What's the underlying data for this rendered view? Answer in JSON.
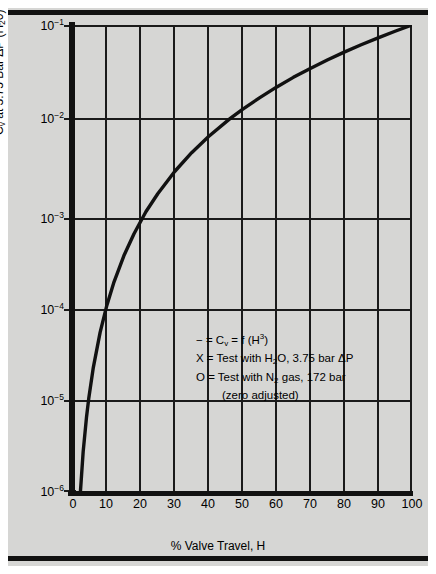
{
  "figure": {
    "background_color": "#d6d6d4",
    "line_color": "#111111"
  },
  "axes": {
    "x": {
      "title": "% Valve Travel, H",
      "ticks": [
        "0",
        "10",
        "20",
        "30",
        "40",
        "50",
        "60",
        "70",
        "80",
        "90",
        "100"
      ],
      "min": 0,
      "max": 100
    },
    "y": {
      "title_parts": {
        "pre": "C",
        "sub": "v",
        "post": " at 3.75 Bar ΔP (H",
        "sub2": "2",
        "post2": "0)"
      },
      "title": "Cv at 3.75 Bar ΔP (H20)",
      "ticks": [
        {
          "mantissa": "10",
          "exp": "−1"
        },
        {
          "mantissa": "10",
          "exp": "−2"
        },
        {
          "mantissa": "10",
          "exp": "−3"
        },
        {
          "mantissa": "10",
          "exp": "−4"
        },
        {
          "mantissa": "10",
          "exp": "−5"
        },
        {
          "mantissa": "10",
          "exp": "−6"
        }
      ],
      "scale": "log",
      "min": 1e-06,
      "max": 0.1
    }
  },
  "legend": {
    "line1_dash": "−",
    "line1_eq": " = C",
    "line1_sub": "v",
    "line1_mid": " = f (H",
    "line1_sup": "3",
    "line1_end": ")",
    "line2_sym": "X",
    "line2_a": " = Test with H",
    "line2_sub": "2",
    "line2_b": "O, 3.75 bar ΔP",
    "line3_sym": "O",
    "line3_a": " = Test with N",
    "line3_sub": "2",
    "line3_b": " gas, 172 bar",
    "line4": "(zero adjusted)"
  },
  "chart_data": {
    "type": "line",
    "title": "",
    "xlabel": "% Valve Travel, H",
    "ylabel": "Cv at 3.75 Bar ΔP (H20)",
    "xlim": [
      0,
      100
    ],
    "ylim": [
      1e-06,
      0.1
    ],
    "yscale": "log",
    "xscale": "linear",
    "grid": true,
    "legend_position": "center",
    "xticks": [
      0,
      10,
      20,
      30,
      40,
      50,
      60,
      70,
      80,
      90,
      100
    ],
    "yticks": [
      1e-06,
      1e-05,
      0.0001,
      0.001,
      0.01,
      0.1
    ],
    "series": [
      {
        "name": "Cv = f (H^3)",
        "relation": "Cv = 1e-7 * H^3",
        "x": [
          1,
          2,
          3,
          4,
          4.64,
          6,
          8,
          10,
          12,
          15,
          18,
          21.5,
          25,
          30,
          35,
          40,
          46.4,
          50,
          55,
          60,
          65,
          70,
          75,
          80,
          85,
          90,
          95,
          100
        ],
        "y": [
          1e-07,
          8e-07,
          2.7e-06,
          6.4e-06,
          1e-05,
          2.16e-05,
          5.12e-05,
          0.0001,
          0.000173,
          0.000338,
          0.000583,
          0.001,
          0.00156,
          0.0027,
          0.00429,
          0.0064,
          0.01,
          0.0125,
          0.0166,
          0.0216,
          0.0275,
          0.0343,
          0.0422,
          0.0512,
          0.0614,
          0.0729,
          0.0857,
          0.1
        ]
      }
    ],
    "annotations": [
      "− = Cv = f (H3)",
      "X = Test with H2O, 3.75 bar ΔP",
      "O = Test with N2 gas, 172 bar",
      "(zero adjusted)"
    ]
  }
}
